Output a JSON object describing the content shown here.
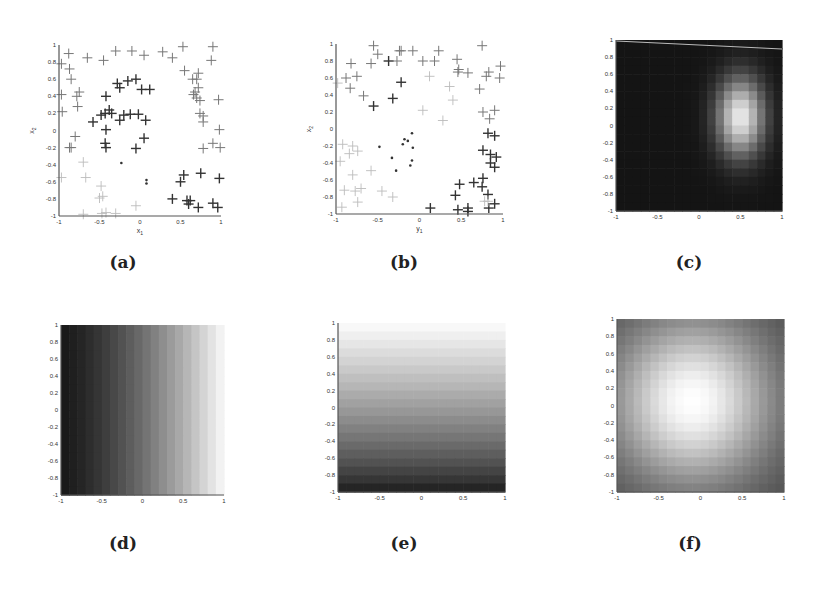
{
  "figure": {
    "panels": [
      {
        "id": "a",
        "caption": "(a)",
        "type": "scatter",
        "xlabel": "x1",
        "ylabel": "x2"
      },
      {
        "id": "b",
        "caption": "(b)",
        "type": "scatter",
        "xlabel": "y1",
        "ylabel": "x2"
      },
      {
        "id": "c",
        "caption": "(c)",
        "type": "heatmap",
        "xlabel": "",
        "ylabel": ""
      },
      {
        "id": "d",
        "caption": "(d)",
        "type": "heatmap",
        "xlabel": "",
        "ylabel": ""
      },
      {
        "id": "e",
        "caption": "(e)",
        "type": "heatmap",
        "xlabel": "",
        "ylabel": ""
      },
      {
        "id": "f",
        "caption": "(f)",
        "type": "heatmap",
        "xlabel": "",
        "ylabel": ""
      }
    ]
  },
  "chart_data": [
    {
      "panel": "a",
      "type": "scatter",
      "title": "",
      "xlabel": "x1",
      "ylabel": "x2",
      "xlim": [
        -1,
        1
      ],
      "ylim": [
        -1,
        1
      ],
      "xticks": [
        "-1",
        "-0.5",
        "0",
        "0.5",
        "1"
      ],
      "yticks": [
        "-1",
        "-0.8",
        "-0.6",
        "-0.4",
        "-0.2",
        "0",
        "0.2",
        "0.4",
        "0.6",
        "0.8",
        "1"
      ],
      "series": [
        {
          "name": "dark plus",
          "marker": "+",
          "shade": "dark",
          "points": [
            [
              -0.28,
              0.55
            ],
            [
              -0.25,
              0.5
            ],
            [
              -0.15,
              0.58
            ],
            [
              -0.05,
              0.6
            ],
            [
              0.02,
              0.48
            ],
            [
              0.12,
              0.48
            ],
            [
              -0.42,
              0.4
            ],
            [
              -0.48,
              0.18
            ],
            [
              -0.43,
              0.2
            ],
            [
              -0.38,
              0.24
            ],
            [
              -0.35,
              0.2
            ],
            [
              -0.25,
              0.12
            ],
            [
              -0.2,
              0.18
            ],
            [
              -0.12,
              0.19
            ],
            [
              -0.02,
              0.19
            ],
            [
              0.07,
              0.12
            ],
            [
              -0.58,
              0.1
            ],
            [
              -0.42,
              0.01
            ],
            [
              0.05,
              -0.09
            ],
            [
              -0.05,
              -0.21
            ],
            [
              -0.43,
              -0.15
            ],
            [
              -0.42,
              -0.2
            ],
            [
              0.4,
              -0.8
            ],
            [
              0.5,
              -0.6
            ],
            [
              0.54,
              -0.52
            ],
            [
              0.58,
              -0.82
            ],
            [
              0.62,
              -0.82
            ],
            [
              0.6,
              -0.86
            ],
            [
              0.72,
              -0.9
            ],
            [
              0.75,
              -0.5
            ],
            [
              0.9,
              -0.85
            ],
            [
              0.96,
              -0.9
            ],
            [
              0.98,
              -0.56
            ]
          ]
        },
        {
          "name": "medium plus",
          "marker": "+",
          "shade": "medium",
          "points": [
            [
              -0.88,
              0.9
            ],
            [
              -0.65,
              0.85
            ],
            [
              -0.45,
              0.82
            ],
            [
              -0.3,
              0.93
            ],
            [
              -0.1,
              0.93
            ],
            [
              0.05,
              0.88
            ],
            [
              0.28,
              0.92
            ],
            [
              0.4,
              0.85
            ],
            [
              0.53,
              0.98
            ],
            [
              0.9,
              0.98
            ],
            [
              0.88,
              0.82
            ],
            [
              0.55,
              0.7
            ],
            [
              0.65,
              0.6
            ],
            [
              0.72,
              0.67
            ],
            [
              0.7,
              0.6
            ],
            [
              0.72,
              0.5
            ],
            [
              0.68,
              0.45
            ],
            [
              0.66,
              0.42
            ],
            [
              0.7,
              0.38
            ],
            [
              0.74,
              0.35
            ],
            [
              0.97,
              0.36
            ],
            [
              0.74,
              0.2
            ],
            [
              0.78,
              0.17
            ],
            [
              0.78,
              0.1
            ],
            [
              0.98,
              0.01
            ],
            [
              0.78,
              -0.21
            ],
            [
              0.9,
              -0.15
            ],
            [
              0.99,
              -0.2
            ],
            [
              -0.87,
              0.72
            ],
            [
              -0.85,
              0.6
            ],
            [
              -0.97,
              0.42
            ],
            [
              -0.78,
              0.4
            ],
            [
              -0.75,
              0.45
            ],
            [
              -0.77,
              0.28
            ],
            [
              -0.96,
              0.22
            ],
            [
              -0.8,
              -0.07
            ],
            [
              -0.85,
              -0.2
            ],
            [
              -0.87,
              -0.2
            ],
            [
              -0.97,
              0.78
            ]
          ]
        },
        {
          "name": "light plus",
          "marker": "+",
          "shade": "light",
          "points": [
            [
              -0.7,
              -0.37
            ],
            [
              -0.67,
              -0.55
            ],
            [
              -0.97,
              -0.55
            ],
            [
              -0.48,
              -0.65
            ],
            [
              -0.5,
              -0.79
            ],
            [
              -0.46,
              -0.77
            ],
            [
              -0.05,
              -0.88
            ],
            [
              -0.7,
              -0.98
            ],
            [
              -0.47,
              -0.97
            ],
            [
              -0.42,
              -0.96
            ],
            [
              -0.3,
              -0.97
            ]
          ]
        },
        {
          "name": "dots",
          "marker": "dot",
          "shade": "dark",
          "points": [
            [
              -0.23,
              -0.38
            ],
            [
              0.08,
              -0.58
            ],
            [
              0.08,
              -0.62
            ]
          ]
        }
      ]
    },
    {
      "panel": "b",
      "type": "scatter",
      "title": "",
      "xlabel": "y1",
      "ylabel": "x2",
      "xlim": [
        -1,
        1
      ],
      "ylim": [
        -1,
        1
      ],
      "xticks": [
        "-1",
        "-0.5",
        "0",
        "0.5",
        "1"
      ],
      "yticks": [
        "-1",
        "-0.8",
        "-0.6",
        "-0.4",
        "-0.2",
        "0",
        "0.2",
        "0.4",
        "0.6",
        "0.8",
        "1"
      ],
      "series": [
        {
          "name": "dark plus",
          "marker": "+",
          "shade": "dark",
          "points": [
            [
              -0.37,
              0.8
            ],
            [
              -0.22,
              0.55
            ],
            [
              -0.32,
              0.36
            ],
            [
              -0.55,
              0.27
            ],
            [
              0.82,
              -0.05
            ],
            [
              0.9,
              -0.08
            ],
            [
              0.76,
              -0.25
            ],
            [
              0.85,
              -0.3
            ],
            [
              0.92,
              -0.33
            ],
            [
              0.85,
              -0.4
            ],
            [
              0.9,
              -0.45
            ],
            [
              0.76,
              -0.58
            ],
            [
              0.75,
              -0.68
            ],
            [
              0.65,
              -0.63
            ],
            [
              0.48,
              -0.65
            ],
            [
              0.43,
              -0.78
            ],
            [
              0.82,
              -0.77
            ],
            [
              0.9,
              -0.88
            ],
            [
              0.13,
              -0.93
            ],
            [
              0.46,
              -0.95
            ],
            [
              0.58,
              -0.93
            ],
            [
              0.58,
              -0.97
            ],
            [
              0.83,
              -0.93
            ]
          ]
        },
        {
          "name": "medium plus",
          "marker": "+",
          "shade": "medium",
          "points": [
            [
              -0.55,
              0.98
            ],
            [
              -0.5,
              0.88
            ],
            [
              -0.22,
              0.92
            ],
            [
              -0.24,
              0.92
            ],
            [
              -0.08,
              0.92
            ],
            [
              0.23,
              0.92
            ],
            [
              -0.27,
              0.8
            ],
            [
              0.04,
              0.8
            ],
            [
              0.18,
              0.8
            ],
            [
              0.45,
              0.82
            ],
            [
              0.75,
              0.98
            ],
            [
              0.97,
              0.74
            ],
            [
              0.47,
              0.7
            ],
            [
              0.46,
              0.67
            ],
            [
              0.58,
              0.66
            ],
            [
              0.8,
              0.62
            ],
            [
              0.83,
              0.67
            ],
            [
              0.96,
              0.6
            ],
            [
              -0.58,
              0.77
            ],
            [
              -0.82,
              0.77
            ],
            [
              -0.75,
              0.62
            ],
            [
              -0.88,
              0.6
            ],
            [
              -0.83,
              0.48
            ],
            [
              -0.67,
              0.39
            ],
            [
              0.72,
              0.47
            ],
            [
              0.76,
              0.2
            ],
            [
              0.9,
              0.22
            ],
            [
              0.84,
              0.12
            ]
          ]
        },
        {
          "name": "light plus",
          "marker": "+",
          "shade": "light",
          "points": [
            [
              0.12,
              0.62
            ],
            [
              0.36,
              0.5
            ],
            [
              0.4,
              0.34
            ],
            [
              0.04,
              0.22
            ],
            [
              0.28,
              0.1
            ],
            [
              -0.98,
              0.54
            ],
            [
              -0.92,
              -0.18
            ],
            [
              -0.8,
              -0.2
            ],
            [
              -0.74,
              -0.26
            ],
            [
              -0.84,
              -0.29
            ],
            [
              -0.95,
              -0.38
            ],
            [
              -0.8,
              -0.54
            ],
            [
              -0.58,
              -0.49
            ],
            [
              -0.7,
              -0.7
            ],
            [
              -0.77,
              -0.73
            ],
            [
              -0.9,
              -0.72
            ],
            [
              -0.45,
              -0.73
            ],
            [
              -0.32,
              -0.8
            ],
            [
              -0.74,
              -0.86
            ],
            [
              -0.93,
              -0.92
            ],
            [
              0.82,
              -0.85
            ],
            [
              0.78,
              -0.85
            ]
          ]
        },
        {
          "name": "dots",
          "marker": "dot",
          "shade": "dark",
          "points": [
            [
              -0.48,
              -0.21
            ],
            [
              -0.18,
              -0.12
            ],
            [
              -0.14,
              -0.14
            ],
            [
              -0.2,
              -0.18
            ],
            [
              -0.09,
              -0.05
            ],
            [
              -0.08,
              -0.22
            ],
            [
              -0.33,
              -0.34
            ],
            [
              -0.09,
              -0.37
            ],
            [
              -0.11,
              -0.43
            ],
            [
              -0.28,
              -0.49
            ]
          ]
        }
      ]
    },
    {
      "panel": "c",
      "type": "heatmap",
      "title": "",
      "xlim": [
        -1,
        1
      ],
      "ylim": [
        -1,
        1
      ],
      "xticks": [
        "-1",
        "-0.5",
        "0",
        "0.5",
        "1"
      ],
      "yticks": [
        "-1",
        "-0.8",
        "-0.6",
        "-0.4",
        "-0.2",
        "0",
        "0.2",
        "0.4",
        "0.6",
        "0.8",
        "1"
      ],
      "description": "dark background with bright blob centered near (0.5, 0.1), elongated vertically; thin light line across the top from (-1,1) to (1,0.9)",
      "peak": [
        0.5,
        0.1
      ]
    },
    {
      "panel": "d",
      "type": "heatmap",
      "title": "",
      "xlim": [
        -1,
        1
      ],
      "ylim": [
        -1,
        1
      ],
      "xticks": [
        "-1",
        "-0.5",
        "0",
        "0.5",
        "1"
      ],
      "yticks": [
        "-1",
        "-0.8",
        "-0.6",
        "-0.4",
        "-0.2",
        "0",
        "0.2",
        "0.4",
        "0.6",
        "0.8",
        "1"
      ],
      "description": "vertical gradient bands, dark at left (x=-1) to white at right (x=1)"
    },
    {
      "panel": "e",
      "type": "heatmap",
      "title": "",
      "xlim": [
        -1,
        1
      ],
      "ylim": [
        -1,
        1
      ],
      "xticks": [
        "-1",
        "-0.5",
        "0",
        "0.5",
        "1"
      ],
      "yticks": [
        "-1",
        "-0.8",
        "-0.6",
        "-0.4",
        "-0.2",
        "0",
        "0.2",
        "0.4",
        "0.6",
        "0.8",
        "1"
      ],
      "description": "horizontal gradient bands, dark at bottom (y=-1) to white at top (y=1)"
    },
    {
      "panel": "f",
      "type": "heatmap",
      "title": "",
      "xlim": [
        -1,
        1
      ],
      "ylim": [
        -1,
        1
      ],
      "xticks": [
        "-1",
        "-0.5",
        "0",
        "0.5",
        "1"
      ],
      "yticks": [
        "-1",
        "-0.8",
        "-0.6",
        "-0.4",
        "-0.2",
        "0",
        "0.2",
        "0.4",
        "0.6",
        "0.8",
        "1"
      ],
      "description": "radial gradient, white center near (-0.1, 0.05) fading to gray at edges, darkest at top-right corner",
      "peak": [
        -0.1,
        0.05
      ]
    }
  ],
  "layout": {
    "panels": {
      "a": {
        "x0": 59,
        "x1": 221,
        "y0": 45,
        "y1": 216,
        "cap_x": 123,
        "cap_y": 252
      },
      "b": {
        "x0": 336,
        "x1": 503,
        "y0": 44,
        "y1": 214,
        "cap_x": 404,
        "cap_y": 252
      },
      "c": {
        "x0": 616,
        "x1": 782,
        "y0": 40,
        "y1": 211,
        "cap_x": 689,
        "cap_y": 252
      },
      "d": {
        "x0": 61,
        "x1": 224,
        "y0": 325,
        "y1": 495,
        "cap_x": 123,
        "cap_y": 533
      },
      "e": {
        "x0": 338,
        "x1": 505,
        "y0": 323,
        "y1": 492,
        "cap_x": 404,
        "cap_y": 533
      },
      "f": {
        "x0": 617,
        "x1": 784,
        "y0": 319,
        "y1": 492,
        "cap_x": 690,
        "cap_y": 533
      }
    }
  }
}
